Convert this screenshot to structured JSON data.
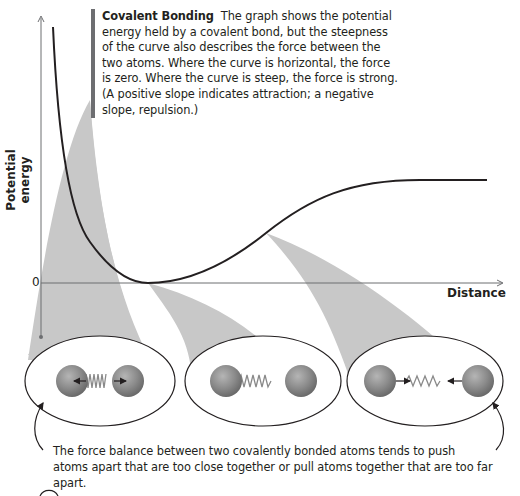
{
  "caption": {
    "title": "Covalent Bonding",
    "body": "The graph shows the potential energy held by a covalent bond, but the steepness of the curve also describes the force between the two atoms. Where the curve is horizontal, the force is zero. Where the curve is steep, the force is strong. (A positive slope indicates attraction; a negative slope, repulsion.)"
  },
  "axes": {
    "y_label": "Potential energy",
    "x_label": "Distance",
    "zero_label": "0"
  },
  "insets": [
    {
      "state": "too close",
      "spring": "compressed",
      "force_arrows": "outward (repulsion)"
    },
    {
      "state": "equilibrium",
      "spring": "relaxed",
      "force_arrows": "none"
    },
    {
      "state": "too far",
      "spring": "stretched",
      "force_arrows": "inward (attraction)"
    }
  ],
  "bottom_caption": "The force balance between two covalently bonded atoms tends to push atoms apart that are too close together or pull atoms together that are too far apart.",
  "colors": {
    "curve": "#231f20",
    "fan": "#c8c8c8",
    "axis": "#6d6e71",
    "accent_bar": "#6d6e71"
  }
}
